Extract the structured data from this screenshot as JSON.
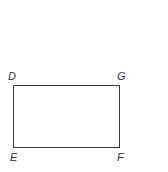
{
  "diagram": {
    "shape": "rectangle",
    "vertices": {
      "top_left": "D",
      "top_right": "G",
      "bottom_left": "E",
      "bottom_right": "F"
    },
    "stroke_color": "#3a3a3a",
    "label_color": "#333333"
  }
}
